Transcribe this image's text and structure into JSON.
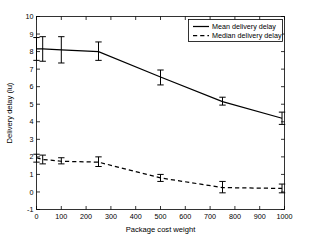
{
  "chart_data": {
    "type": "line",
    "title": "",
    "xlabel": "Package cost weight",
    "ylabel": "Delivery delay (lu)",
    "xlim": [
      0,
      1000
    ],
    "ylim": [
      -1,
      10
    ],
    "xticks": [
      0,
      100,
      200,
      300,
      400,
      500,
      600,
      700,
      800,
      900,
      1000
    ],
    "xticklabels": [
      "0",
      "100",
      "200",
      "300",
      "400",
      "500",
      "600",
      "700",
      "800",
      "900",
      "1000"
    ],
    "yticks": [
      -1,
      0,
      1,
      2,
      3,
      4,
      5,
      6,
      7,
      8,
      9,
      10
    ],
    "yticklabels": [
      "-1",
      "0",
      "1",
      "2",
      "3",
      "4",
      "5",
      "6",
      "7",
      "8",
      "9",
      "10"
    ],
    "grid": false,
    "legend_position": "upper right",
    "x": [
      0,
      25,
      100,
      250,
      500,
      750,
      990
    ],
    "series": [
      {
        "name": "Mean delivery delay",
        "style": "solid",
        "color": "#000000",
        "values": [
          8.15,
          8.15,
          8.1,
          8.0,
          6.55,
          5.15,
          4.2
        ],
        "err_low": [
          7.5,
          7.45,
          7.35,
          7.5,
          6.1,
          4.95,
          3.85
        ],
        "err_high": [
          8.8,
          8.85,
          8.85,
          8.55,
          6.95,
          5.4,
          4.55
        ]
      },
      {
        "name": "Median delivery delay",
        "style": "dashed",
        "color": "#000000",
        "values": [
          1.95,
          1.85,
          1.75,
          1.7,
          0.8,
          0.25,
          0.2
        ],
        "err_low": [
          1.7,
          1.6,
          1.6,
          1.45,
          0.6,
          -0.05,
          -0.05
        ],
        "err_high": [
          2.15,
          2.1,
          1.95,
          2.0,
          1.0,
          0.6,
          0.45
        ]
      }
    ]
  },
  "legend": {
    "entries": [
      {
        "label": "Mean delivery delay"
      },
      {
        "label": "Median delivery delay"
      }
    ]
  }
}
